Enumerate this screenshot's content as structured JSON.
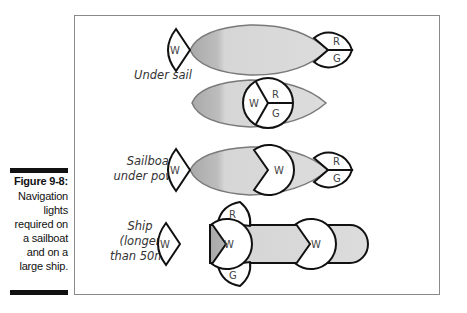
{
  "caption": {
    "title": "Figure 9-8:",
    "body": "Navigation\nlights\nrequired on\na sailboat\nand on a\nlarge ship."
  },
  "rows": [
    {
      "label": "Under sail",
      "lights": [
        "W",
        "R",
        "G"
      ]
    },
    {
      "label": "",
      "lights": [
        "W",
        "R",
        "G"
      ]
    },
    {
      "label": "Sailboat\nunder power",
      "lights": [
        "W",
        "W",
        "R",
        "G"
      ]
    },
    {
      "label": "Ship\n(longer\nthan 50m)",
      "lights": [
        "W",
        "R",
        "W",
        "G",
        "W"
      ]
    }
  ],
  "lights": {
    "white": "W",
    "red": "R",
    "green": "G"
  },
  "colors": {
    "hull_fill": "#cfcfcf",
    "hull_stroke": "#7a7a7a",
    "light_stroke": "#111111",
    "frame": "#8a8a8a"
  }
}
